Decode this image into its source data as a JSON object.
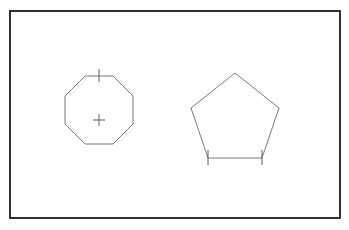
{
  "canvas": {
    "width": 349,
    "height": 230,
    "background_color": "#ffffff",
    "description": "Technical line drawing of two regular polygons"
  },
  "frame": {
    "name": "drawing-border",
    "x": 10,
    "y": 11,
    "width": 330,
    "height": 207,
    "stroke_color": "#1a1a1a",
    "stroke_width": 1.8,
    "fill": "none"
  },
  "shapes": [
    {
      "id": "octagon",
      "label": "Octagon",
      "sides": 8,
      "stroke_color": "#6b6b6b",
      "stroke_width": 0.9,
      "center": {
        "x": 99,
        "y": 120
      },
      "circumradius": 36,
      "rotation_deg": 22.5,
      "points": "85,76 113,76 133,96 133,124 113,144 85,144 65,124 65,96",
      "markers": [
        {
          "id": "octagon-center-crosshair",
          "type": "crosshair",
          "x": 99,
          "y": 120,
          "arm_length": 6,
          "stroke_color": "#4d4d4d",
          "stroke_width": 0.9
        },
        {
          "id": "octagon-top-edge-tick",
          "type": "vertical-tick",
          "x": 99,
          "y": 76,
          "extent_up": 7,
          "extent_down": 6,
          "stroke_color": "#4d4d4d",
          "stroke_width": 0.9
        }
      ]
    },
    {
      "id": "pentagon",
      "label": "Pentagon",
      "sides": 5,
      "stroke_color": "#6b6b6b",
      "stroke_width": 0.9,
      "center": {
        "x": 235,
        "y": 117
      },
      "circumradius": 45,
      "rotation_deg": 0,
      "points": "235,73 279,108 262,158 208,158 191,108",
      "markers": [
        {
          "id": "pentagon-bottom-left-tick",
          "type": "vertical-tick",
          "x": 208,
          "y": 158,
          "extent_up": 8,
          "extent_down": 7,
          "stroke_color": "#4d4d4d",
          "stroke_width": 0.9
        },
        {
          "id": "pentagon-bottom-right-tick",
          "type": "vertical-tick",
          "x": 262,
          "y": 158,
          "extent_up": 8,
          "extent_down": 7,
          "stroke_color": "#4d4d4d",
          "stroke_width": 0.9
        }
      ]
    }
  ]
}
